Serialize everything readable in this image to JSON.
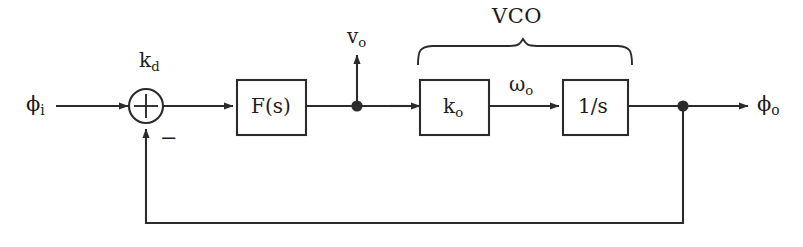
{
  "diagram": {
    "stroke_color": "#2b2b2b",
    "background_color": "#ffffff",
    "group_label": "VCO",
    "input_signal": "ϕ",
    "input_subscript": "i",
    "output_signal": "ϕ",
    "output_subscript": "o",
    "summing_gain": "k",
    "summing_gain_subscript": "d",
    "summing_sign_negative": "−",
    "filter_block": "F(s)",
    "tap_signal": "v",
    "tap_signal_subscript": "o",
    "vco_gain_block": "k",
    "vco_gain_block_subscript": "o",
    "vco_frequency_signal": "ω",
    "vco_frequency_signal_subscript": "o",
    "integrator_block": "1/s"
  }
}
